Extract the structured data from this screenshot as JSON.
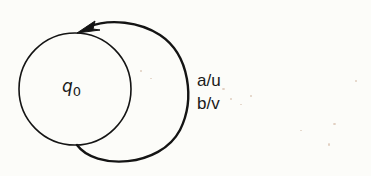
{
  "diagram": {
    "type": "finite-state-transducer",
    "states": [
      {
        "id": "q0",
        "label_base": "q",
        "label_sub": "0",
        "cx": 75,
        "cy": 89,
        "r": 56
      }
    ],
    "transitions": [
      {
        "from": "q0",
        "to": "q0",
        "kind": "self-loop",
        "labels": [
          "a/u",
          "b/v"
        ]
      }
    ],
    "colors": {
      "stroke": "#141414",
      "background": "#fcfcf9",
      "text": "#1a1a1a"
    }
  }
}
